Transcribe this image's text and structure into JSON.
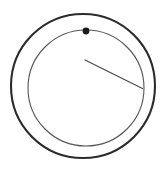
{
  "canvas": {
    "width": 166,
    "height": 175,
    "background_color": "#ffffff",
    "title": "Concentric circle diagram with marker dot and radial line"
  },
  "palette": {
    "outer_ring_color": "#2b2b2b",
    "inner_ring_color": "#555555",
    "marker_color": "#1a1a1a",
    "line_color": "#4a4a4a"
  },
  "diagram": {
    "type": "line-art",
    "outer_circle": {
      "label": "outer ring",
      "center_x": 83,
      "center_y": 86,
      "radius": 72,
      "stroke_width": 2.1,
      "stroke_color": "#2b2b2b",
      "fill": "none"
    },
    "inner_circle": {
      "label": "inner ring",
      "center_x": 86,
      "center_y": 88,
      "radius": 58,
      "stroke_width": 1.1,
      "stroke_color": "#555555",
      "fill": "none"
    },
    "marker_dot": {
      "label": "marker dot on inner ring",
      "center_x": 86,
      "center_y": 31,
      "radius": 3.4,
      "fill_color": "#1a1a1a"
    },
    "radial_line": {
      "label": "radial line",
      "x1": 85,
      "y1": 60,
      "x2": 142.5,
      "y2": 88.5,
      "stroke_width": 1.2,
      "stroke_color": "#4a4a4a"
    }
  }
}
